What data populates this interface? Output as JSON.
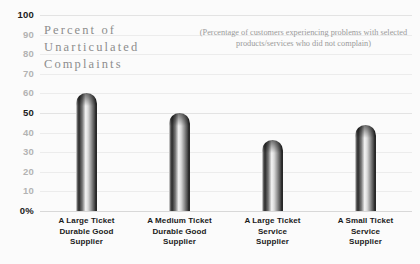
{
  "chart_data": {
    "type": "bar",
    "title": "Percent of\nUnarticulated\nComplaints",
    "subtitle": "(Percentage of customers experiencing problems with\nselected products/services who did not complain)",
    "xlabel": "",
    "ylabel": "",
    "ylim": [
      0,
      100
    ],
    "grid": true,
    "legend": "none",
    "categories": [
      "A Large Ticket\nDurable Good\nSupplier",
      "A Medium Ticket\nDurable Good\nSupplier",
      "A Large Ticket\nService\nSupplier",
      "A Small Ticket\nService\nSupplier"
    ],
    "values": [
      60,
      50,
      36,
      44
    ],
    "ticks": [
      {
        "label": "100",
        "value": 100,
        "emphasis": "strong"
      },
      {
        "label": "90",
        "value": 90,
        "emphasis": "light"
      },
      {
        "label": "80",
        "value": 80,
        "emphasis": "light"
      },
      {
        "label": "70",
        "value": 70,
        "emphasis": "light"
      },
      {
        "label": "60",
        "value": 60,
        "emphasis": "light"
      },
      {
        "label": "50",
        "value": 50,
        "emphasis": "strong"
      },
      {
        "label": "40",
        "value": 40,
        "emphasis": "light"
      },
      {
        "label": "30",
        "value": 30,
        "emphasis": "light"
      },
      {
        "label": "20",
        "value": 20,
        "emphasis": "light"
      },
      {
        "label": "10",
        "value": 10,
        "emphasis": "light"
      },
      {
        "label": "0%",
        "value": 0,
        "emphasis": "strong"
      }
    ],
    "colors": {
      "bar_dark": "#1c1c1c",
      "bar_light": "#f4f4f4",
      "gridline": "#ececec",
      "title_text": "#8d8d8d",
      "axis_text": "#1a1a1a",
      "axis_text_muted": "#b3b3b3",
      "background": "#fbfbfb"
    }
  }
}
